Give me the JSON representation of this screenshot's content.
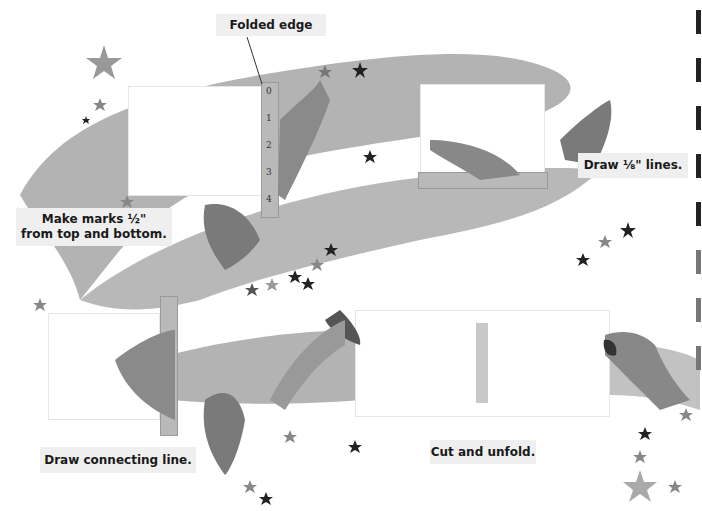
{
  "labels": {
    "folded_edge": "Folded edge",
    "step1": "Make marks ½\" from top and bottom.",
    "step1_line1": "Make marks ½\"",
    "step1_line2": "from top and bottom.",
    "step2": "Draw ⅛\" lines.",
    "step3": "Draw connecting line.",
    "step4": "Cut and unfold."
  },
  "ruler": {
    "ticks_major": [
      "0",
      "1",
      "2",
      "3",
      "4"
    ],
    "tick_minor": "1/2"
  },
  "colors": {
    "ribbon": "#b3b3b3",
    "label_bg": "#efefef",
    "star_dark": "#222222",
    "star_mid": "#888888",
    "ruler": "#b9b9b9",
    "paper": "#ffffff",
    "cut_slot": "#c8c8c8"
  }
}
